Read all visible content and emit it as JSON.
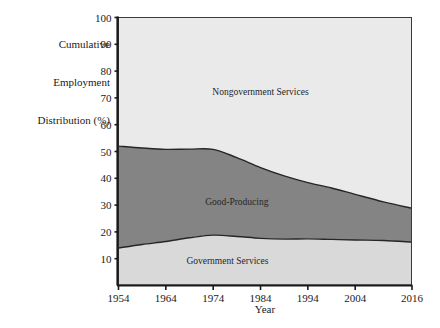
{
  "chart_data": {
    "type": "area",
    "title": "",
    "subtitle": "",
    "xlabel": "Year",
    "ylabel": "Cumulative Employment Distribution (%)",
    "ylabel_lines": [
      "Cumulative",
      "Employment",
      "Distribution (%)"
    ],
    "stacked": true,
    "grid": false,
    "legend_position": "inline-labels",
    "xlim": [
      1954,
      2016
    ],
    "ylim": [
      0,
      100
    ],
    "x_ticks": [
      1954,
      1964,
      1974,
      1984,
      1994,
      2004,
      2016
    ],
    "x_tick_labels": [
      "1954",
      "1964",
      "1974",
      "1984",
      "1994",
      "2004",
      "2016"
    ],
    "y_ticks": [
      10,
      20,
      30,
      40,
      50,
      60,
      70,
      80,
      90,
      100
    ],
    "y_tick_labels": [
      "10",
      "20",
      "30",
      "40",
      "50",
      "60",
      "70",
      "80",
      "90",
      "100"
    ],
    "x": [
      1954,
      1959,
      1964,
      1969,
      1974,
      1979,
      1984,
      1989,
      1994,
      1999,
      2004,
      2010,
      2016
    ],
    "series": [
      {
        "name": "Government Services",
        "color": "#d9d9d9",
        "label_x": 1977,
        "label_y": 8,
        "values": [
          14.0,
          15.3,
          16.4,
          17.8,
          18.8,
          18.3,
          17.6,
          17.3,
          17.4,
          17.2,
          17.0,
          16.8,
          16.2
        ]
      },
      {
        "name": "Good-Producing",
        "color": "#848484",
        "label_x": 1979,
        "label_y": 30,
        "values": [
          38.0,
          36.0,
          34.4,
          33.1,
          32.0,
          29.4,
          26.4,
          23.6,
          21.0,
          19.2,
          17.0,
          14.4,
          12.6
        ]
      },
      {
        "name": "Nongovernment Services",
        "color": "#eaeaea",
        "label_x": 1984,
        "label_y": 71,
        "values": [
          48.0,
          48.7,
          49.2,
          49.1,
          49.2,
          52.3,
          56.0,
          59.1,
          61.6,
          63.6,
          66.0,
          68.8,
          71.2
        ]
      }
    ],
    "cumulative_upper_boundaries": {
      "government_services": [
        14.0,
        15.3,
        16.4,
        17.8,
        18.8,
        18.3,
        17.6,
        17.3,
        17.4,
        17.2,
        17.0,
        16.8,
        16.2
      ],
      "good_producing": [
        52.0,
        51.3,
        50.8,
        50.9,
        50.8,
        47.7,
        44.0,
        40.9,
        38.4,
        36.4,
        34.0,
        31.2,
        28.8
      ],
      "nongovernment_services": [
        100,
        100,
        100,
        100,
        100,
        100,
        100,
        100,
        100,
        100,
        100,
        100,
        100
      ]
    }
  },
  "axes": {
    "y_title_line1": "Cumulative",
    "y_title_line2": "Employment",
    "y_title_line3": "Distribution (%)",
    "x_title": "Year"
  },
  "ticks": {
    "y": [
      "100",
      "90",
      "80",
      "70",
      "60",
      "50",
      "40",
      "30",
      "20",
      "10"
    ],
    "x": [
      "1954",
      "1964",
      "1974",
      "1984",
      "1994",
      "2004",
      "2016"
    ]
  },
  "area_labels": {
    "top": "Nongovernment Services",
    "middle": "Good-Producing",
    "bottom": "Government Services"
  },
  "colors": {
    "top_band": "#eaeaea",
    "middle_band": "#848484",
    "bottom_band": "#d9d9d9",
    "axis": "#1a1a1a",
    "boundary_line": "#262626",
    "background": "#ffffff"
  }
}
